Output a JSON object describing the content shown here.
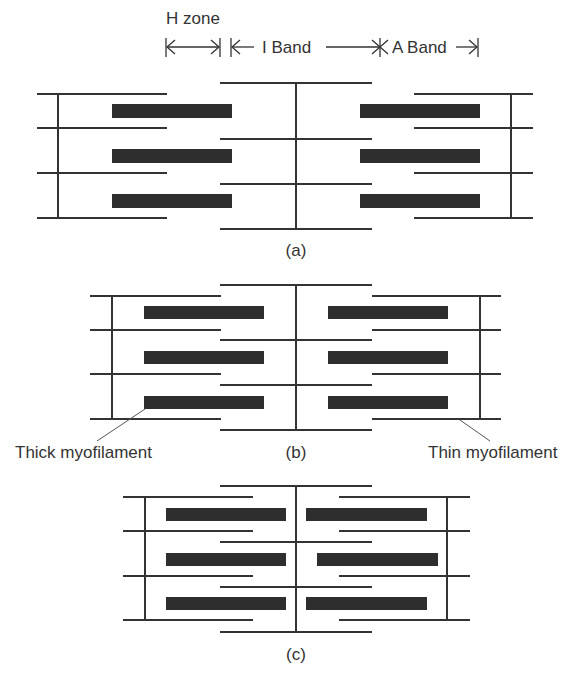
{
  "header": {
    "h_zone": "H zone",
    "i_band": "I Band",
    "a_band": "A Band"
  },
  "panels": [
    {
      "id": "a",
      "caption": "(a)",
      "state": "relaxed"
    },
    {
      "id": "b",
      "caption": "(b)",
      "state": "partially contracted"
    },
    {
      "id": "c",
      "caption": "(c)",
      "state": "fully contracted"
    }
  ],
  "labels": {
    "thick": "Thick myofilament",
    "thin": "Thin myofilament"
  },
  "colors": {
    "line": "#333333",
    "thick_filament": "#2e2e2e",
    "background": "#ffffff"
  }
}
